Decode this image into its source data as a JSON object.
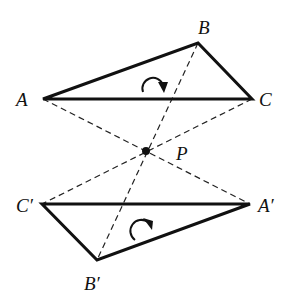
{
  "diagram": {
    "type": "point-reflection-of-triangle",
    "center": {
      "label": "P",
      "x": 146,
      "y": 151
    },
    "triangles": [
      {
        "name": "original",
        "vertices": [
          {
            "label": "A",
            "x": 43,
            "y": 99
          },
          {
            "label": "B",
            "x": 198,
            "y": 43
          },
          {
            "label": "C",
            "x": 252,
            "y": 99
          }
        ],
        "orientation": "clockwise"
      },
      {
        "name": "image",
        "vertices": [
          {
            "label": "A′",
            "x": 250,
            "y": 204
          },
          {
            "label": "B′",
            "x": 97,
            "y": 260
          },
          {
            "label": "C′",
            "x": 42,
            "y": 204
          }
        ],
        "orientation": "clockwise"
      }
    ],
    "dashed_segments": [
      "A–A′",
      "B–B′",
      "C–C′"
    ],
    "labels": {
      "A": "A",
      "B": "B",
      "C": "C",
      "P": "P",
      "A_prime": "A′",
      "B_prime": "B′",
      "C_prime": "C′"
    }
  }
}
